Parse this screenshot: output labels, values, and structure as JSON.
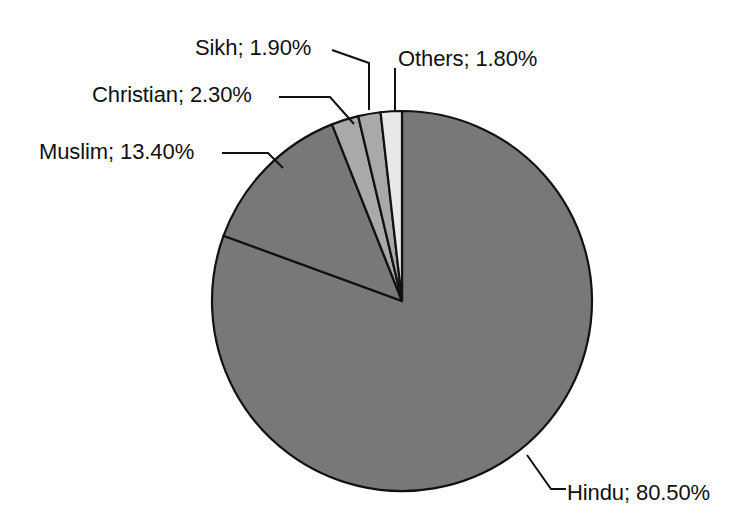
{
  "chart_data": {
    "type": "pie",
    "title": "",
    "subtitle": "",
    "xlabel": "",
    "ylabel": "",
    "legend_position": "none",
    "grid": false,
    "label_format": "category; percent",
    "units": "percent",
    "start_angle_deg": 0,
    "direction": "counterclockwise",
    "categories": [
      "Hindu",
      "Muslim",
      "Christian",
      "Sikh",
      "Others"
    ],
    "values": [
      80.5,
      13.4,
      2.3,
      1.9,
      1.8
    ],
    "slices": [
      {
        "name": "Others",
        "category": "Others",
        "value": 1.8,
        "value_text": "1.80%",
        "label": "Others; 1.80%",
        "color": "#e8e8e8",
        "outline": "#111111"
      },
      {
        "name": "Sikh",
        "category": "Sikh",
        "value": 1.9,
        "value_text": "1.90%",
        "label": "Sikh; 1.90%",
        "color": "#a9a9a9",
        "outline": "#111111"
      },
      {
        "name": "Christian",
        "category": "Christian",
        "value": 2.3,
        "value_text": "2.30%",
        "label": "Christian; 2.30%",
        "color": "#a9a9a9",
        "outline": "#111111"
      },
      {
        "name": "Muslim",
        "category": "Muslim",
        "value": 13.4,
        "value_text": "13.40%",
        "label": "Muslim; 13.40%",
        "color": "#787878",
        "outline": "#111111"
      },
      {
        "name": "Hindu",
        "category": "Hindu",
        "value": 80.5,
        "value_text": "80.50%",
        "label": "Hindu; 80.50%",
        "color": "#787878",
        "outline": "#111111"
      }
    ],
    "total": 99.9,
    "geometry": {
      "center_x": 402,
      "center_y": 301,
      "radius": 190
    }
  },
  "labels": {
    "sikh": "Sikh; 1.90%",
    "others": "Others; 1.80%",
    "christian": "Christian; 2.30%",
    "muslim": "Muslim; 13.40%",
    "hindu": "Hindu; 80.50%"
  },
  "colors": {
    "background": "#ffffff",
    "outline": "#111111",
    "text": "#111111",
    "slice_major": "#787878",
    "slice_mid": "#a9a9a9",
    "slice_light": "#e8e8e8"
  }
}
